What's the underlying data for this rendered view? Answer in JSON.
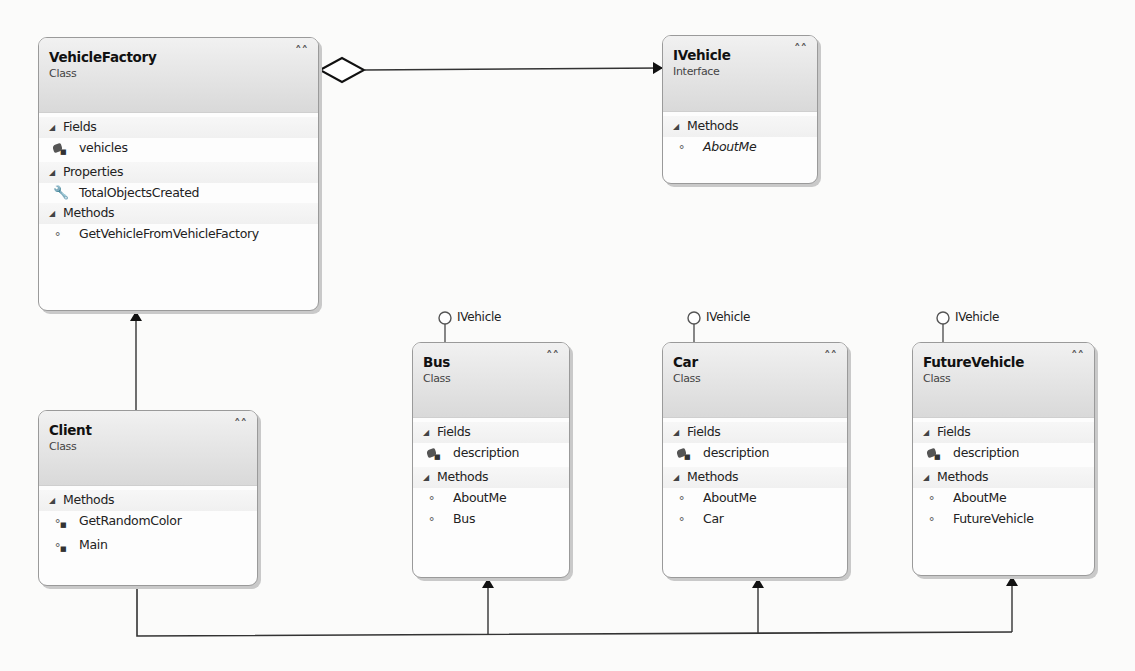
{
  "diagram": {
    "type": "UML class diagram",
    "classes": [
      {
        "id": "vehicle-factory",
        "name": "VehicleFactory",
        "stereotype": "Class",
        "sections": [
          {
            "title": "Fields",
            "members": [
              {
                "name": "vehicles",
                "icon": "private-field-icon"
              }
            ]
          },
          {
            "title": "Properties",
            "members": [
              {
                "name": "TotalObjectsCreated",
                "icon": "property-wrench-icon"
              }
            ]
          },
          {
            "title": "Methods",
            "members": [
              {
                "name": "GetVehicleFromVehicleFactory",
                "icon": "method-icon"
              }
            ]
          }
        ]
      },
      {
        "id": "ivehicle",
        "name": "IVehicle",
        "stereotype": "Interface",
        "sections": [
          {
            "title": "Methods",
            "members": [
              {
                "name": "AboutMe",
                "icon": "method-icon",
                "italic": true
              }
            ]
          }
        ]
      },
      {
        "id": "client",
        "name": "Client",
        "stereotype": "Class",
        "sections": [
          {
            "title": "Methods",
            "members": [
              {
                "name": "GetRandomColor",
                "icon": "private-method-icon"
              },
              {
                "name": "Main",
                "icon": "private-method-icon"
              }
            ]
          }
        ]
      },
      {
        "id": "bus",
        "name": "Bus",
        "stereotype": "Class",
        "implements": "IVehicle",
        "sections": [
          {
            "title": "Fields",
            "members": [
              {
                "name": "description",
                "icon": "private-field-icon"
              }
            ]
          },
          {
            "title": "Methods",
            "members": [
              {
                "name": "AboutMe",
                "icon": "method-icon"
              },
              {
                "name": "Bus",
                "icon": "method-icon"
              }
            ]
          }
        ]
      },
      {
        "id": "car",
        "name": "Car",
        "stereotype": "Class",
        "implements": "IVehicle",
        "sections": [
          {
            "title": "Fields",
            "members": [
              {
                "name": "description",
                "icon": "private-field-icon"
              }
            ]
          },
          {
            "title": "Methods",
            "members": [
              {
                "name": "AboutMe",
                "icon": "method-icon"
              },
              {
                "name": "Car",
                "icon": "method-icon"
              }
            ]
          }
        ]
      },
      {
        "id": "future-vehicle",
        "name": "FutureVehicle",
        "stereotype": "Class",
        "implements": "IVehicle",
        "sections": [
          {
            "title": "Fields",
            "members": [
              {
                "name": "description",
                "icon": "private-field-icon"
              }
            ]
          },
          {
            "title": "Methods",
            "members": [
              {
                "name": "AboutMe",
                "icon": "method-icon"
              },
              {
                "name": "FutureVehicle",
                "icon": "method-icon"
              }
            ]
          }
        ]
      }
    ],
    "relationships": [
      {
        "from": "VehicleFactory",
        "to": "IVehicle",
        "type": "aggregation"
      },
      {
        "from": "Client",
        "to": "VehicleFactory",
        "type": "association"
      },
      {
        "from": "Client",
        "to": "Bus",
        "type": "association"
      },
      {
        "from": "Client",
        "to": "Car",
        "type": "association"
      },
      {
        "from": "Client",
        "to": "FutureVehicle",
        "type": "association"
      }
    ],
    "colors": {
      "header_gradient_top": "#f1f1f1",
      "header_gradient_bottom": "#d9d9d9",
      "border": "#9a9a9a",
      "line": "#222222"
    }
  }
}
